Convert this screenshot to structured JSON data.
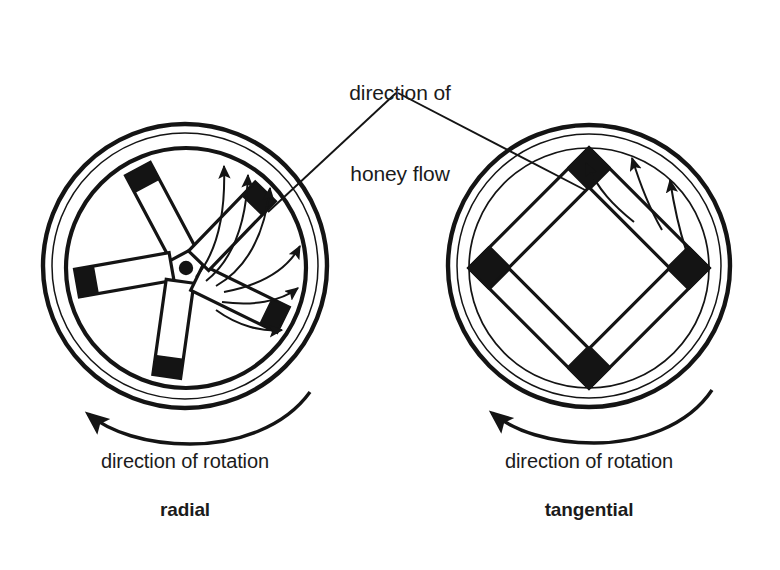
{
  "figure": {
    "title_callout": {
      "line1": "direction of",
      "line2": "honey flow",
      "text": "direction of honey flow"
    },
    "panels": [
      {
        "id": "radial",
        "name_label": "radial",
        "rotation_label": "direction of rotation",
        "rotation_sense": "counter-clockwise",
        "frame_count": 5,
        "frame_orientation": "radial",
        "flow_arrow_count": 6,
        "hub": "center-dot"
      },
      {
        "id": "tangential",
        "name_label": "tangential",
        "rotation_label": "direction of rotation",
        "rotation_sense": "counter-clockwise",
        "frame_count": 4,
        "frame_orientation": "tangential-square",
        "flow_arrow_count": 3,
        "hub": "none"
      }
    ],
    "colors": {
      "ink": "#141414",
      "paper": "#ffffff",
      "frame_fill": "#ffffff",
      "frame_cap": "#141414"
    },
    "geometry": {
      "left_center_x": 185,
      "left_center_y": 266,
      "left_radius": 142,
      "right_center_x": 589,
      "right_center_y": 266,
      "right_radius": 141
    }
  }
}
